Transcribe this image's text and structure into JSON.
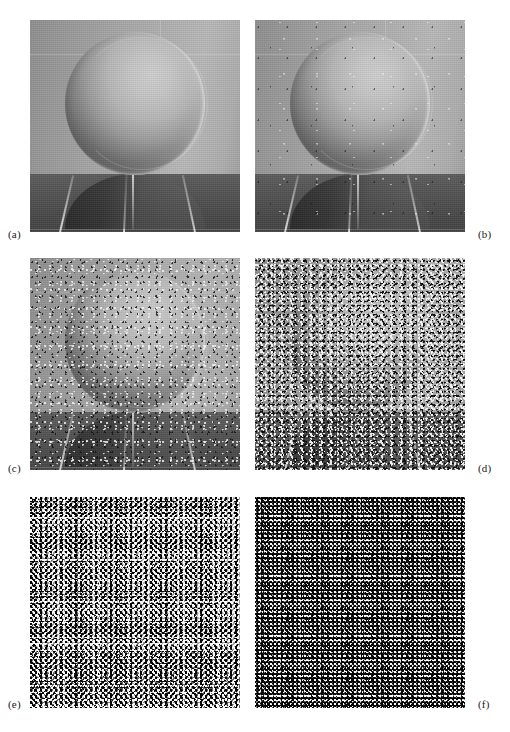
{
  "figure": {
    "kind": "image-grid",
    "rows": 3,
    "columns": 2,
    "background_color": "#ffffff",
    "text_color": "#1a1a1a"
  },
  "scene": {
    "subject": "sphere-on-tiled-floor",
    "wall_color": "#a8a8a8",
    "floor_color": "#4c4c4c",
    "sphere_highlight_color": "#cfcfcf",
    "sphere_shadow_color": "#343434",
    "grout_color": "#e6e6e6"
  },
  "panels": [
    {
      "id": "a",
      "label": "(a)",
      "noise_level": "none",
      "noise_class": "lvl-a",
      "wash": 0.0,
      "label_side": "left",
      "x": 30,
      "y": 20,
      "w": 210,
      "h": 212,
      "label_x": 8,
      "label_y": 228
    },
    {
      "id": "b",
      "label": "(b)",
      "noise_level": "very-low",
      "noise_class": "lvl-b",
      "wash": 0.0,
      "label_side": "right",
      "x": 255,
      "y": 20,
      "w": 210,
      "h": 212,
      "label_x": 478,
      "label_y": 228
    },
    {
      "id": "c",
      "label": "(c)",
      "noise_level": "low",
      "noise_class": "lvl-c",
      "wash": 0.05,
      "label_side": "left",
      "x": 30,
      "y": 258,
      "w": 210,
      "h": 212,
      "label_x": 8,
      "label_y": 462
    },
    {
      "id": "d",
      "label": "(d)",
      "noise_level": "moderate",
      "noise_class": "lvl-d",
      "wash": 0.14,
      "label_side": "right",
      "x": 255,
      "y": 258,
      "w": 210,
      "h": 212,
      "label_x": 478,
      "label_y": 462
    },
    {
      "id": "e",
      "label": "(e)",
      "noise_level": "high",
      "noise_class": "lvl-e",
      "wash": 0.34,
      "label_side": "left",
      "x": 30,
      "y": 497,
      "w": 210,
      "h": 211,
      "label_x": 8,
      "label_y": 698
    },
    {
      "id": "f",
      "label": "(f)",
      "noise_level": "severe",
      "noise_class": "lvl-f",
      "wash": 0.78,
      "label_side": "right",
      "x": 255,
      "y": 497,
      "w": 210,
      "h": 211,
      "label_x": 478,
      "label_y": 698
    }
  ]
}
